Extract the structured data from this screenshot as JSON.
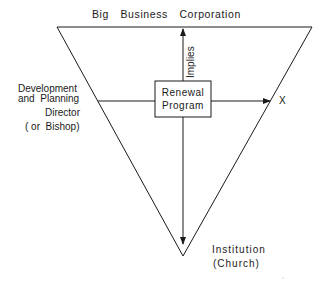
{
  "diagram": {
    "title": "Big Business Corporation",
    "center_box": {
      "line1": "Renewal",
      "line2": "Program"
    },
    "up_arrow_label": "Implies",
    "right_arrow_label": "X",
    "left_label": {
      "line1": "Development",
      "line2": "and  Planning",
      "line3": "Director",
      "line4": "( or  Bishop)"
    },
    "bottom_label": {
      "line1": "Institution",
      "line2": "(Church)"
    },
    "colors": {
      "line": "#1a1a1a",
      "background": "#ffffff"
    }
  }
}
